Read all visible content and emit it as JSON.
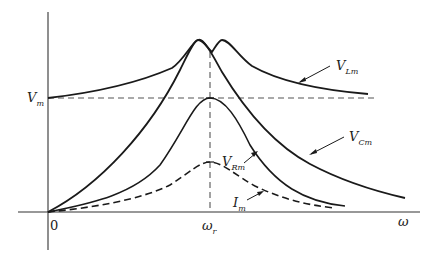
{
  "diagram": {
    "axes": {
      "x_label": "ω",
      "origin_label": "0",
      "x_tick_label": "ω",
      "x_tick_sub": "r",
      "y_tick_label": "V",
      "y_tick_sub": "m"
    },
    "curves": [
      {
        "id": "VLm",
        "label": "V",
        "sub": "Lm",
        "style": "solid",
        "description": "starts at V_m, peaks just right of ω_r, decays toward V_m"
      },
      {
        "id": "VCm",
        "label": "V",
        "sub": "Cm",
        "style": "solid",
        "description": "starts at 0, peaks just left of ω_r, decays toward 0"
      },
      {
        "id": "VRm",
        "label": "V",
        "sub": "Rm",
        "style": "solid",
        "description": "starts at 0, peaks at V_m at ω_r"
      },
      {
        "id": "Im",
        "label": "I",
        "sub": "m",
        "style": "dashed",
        "description": "starts at 0, peaks at ω_r"
      }
    ],
    "reference_lines": [
      {
        "id": "Vm-level",
        "style": "dashed",
        "orientation": "horizontal"
      },
      {
        "id": "omega-r",
        "style": "dashed",
        "orientation": "vertical"
      }
    ],
    "colors": {
      "line": "#1a1a1a",
      "dash": "#555555",
      "background": "#ffffff"
    }
  }
}
